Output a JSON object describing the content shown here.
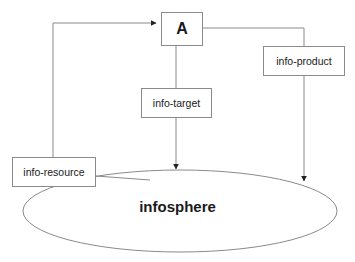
{
  "diagram": {
    "background_color": "#ffffff",
    "stroke_color": "#8a8a8a",
    "text_color": "#1a1a1a",
    "nodes": {
      "agent": {
        "label": "A",
        "shape": "rectangle"
      },
      "info_product": {
        "label": "info-product",
        "shape": "rectangle"
      },
      "info_target": {
        "label": "info-target",
        "shape": "rectangle"
      },
      "info_resource": {
        "label": "info-resource",
        "shape": "rectangle"
      },
      "infosphere": {
        "label": "infosphere",
        "shape": "ellipse"
      }
    },
    "edges": [
      {
        "name": "resource-to-agent",
        "from": "info-resource",
        "to": "A",
        "arrowhead": "at-A-left"
      },
      {
        "name": "agent-to-target-to-infosphere",
        "from": "A",
        "to": "infosphere",
        "via": "info-target",
        "arrowhead": "at-infosphere-top"
      },
      {
        "name": "agent-to-product-to-infosphere",
        "from": "A",
        "to": "infosphere",
        "via": "info-product",
        "arrowhead": "at-infosphere-right"
      },
      {
        "name": "infosphere-to-resource",
        "from": "infosphere",
        "to": "info-resource",
        "arrowhead": "none"
      }
    ]
  }
}
